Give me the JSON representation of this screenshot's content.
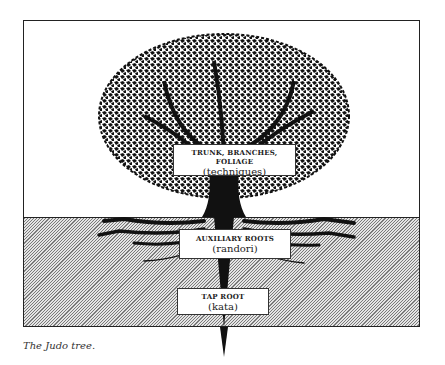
{
  "diagram": {
    "title": "The Judo tree",
    "labels": [
      {
        "heading": "TRUNK, BRANCHES, FOLIAGE",
        "sub": "(techniques)"
      },
      {
        "heading": "AUXILIARY ROOTS",
        "sub": "(randori)"
      },
      {
        "heading": "TAP ROOT",
        "sub": "(kata)"
      }
    ],
    "regions": [
      "sky",
      "soil"
    ],
    "colors": {
      "ink": "#111111",
      "soil_light": "#e4e4e4",
      "soil_dark": "#7a7a7a",
      "background": "#ffffff"
    }
  },
  "caption": "The Judo tree."
}
